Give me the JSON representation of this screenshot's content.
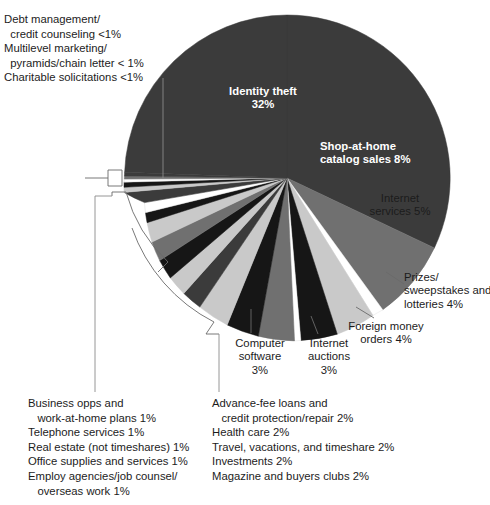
{
  "chart_data": {
    "type": "pie",
    "title": "",
    "legend_position": "callouts",
    "grid": false,
    "unit": "percent",
    "categories": [
      "Identity theft",
      "Shop-at-home catalog sales",
      "Internet services",
      "Prizes/sweepstakes and lotteries",
      "Foreign money orders",
      "Internet auctions",
      "Computer software",
      "Advance-fee loans and credit protection/repair",
      "Health care",
      "Travel, vacations, and timeshare",
      "Investments",
      "Magazine and buyers clubs",
      "Business opps and work-at-home plans",
      "Telephone services",
      "Real estate (not timeshares)",
      "Office supplies and services",
      "Employ agencies/job counsel/overseas work",
      "Debt management/credit counseling",
      "Multilevel marketing/pyramids/chain letter",
      "Charitable solicitations"
    ],
    "values": [
      32,
      8,
      5,
      4,
      4,
      3,
      3,
      2,
      2,
      2,
      2,
      2,
      1,
      1,
      1,
      1,
      1,
      0.6,
      0.6,
      0.6
    ],
    "value_labels": [
      "32%",
      "8%",
      "5%",
      "4%",
      "4%",
      "3%",
      "3%",
      "2%",
      "2%",
      "2%",
      "2%",
      "2%",
      "1%",
      "1%",
      "1%",
      "1%",
      "1%",
      "<1%",
      "< 1%",
      "<1%"
    ]
  },
  "pie_labels": {
    "identity_theft": "Identity theft\n32%",
    "shop_at_home": "Shop-at-home\ncatalog sales 8%",
    "internet_services": "Internet\nservices 5%",
    "prizes": "Prizes/\nsweepstakes and\nlotteries 4%",
    "foreign_money": "Foreign money\norders 4%",
    "computer_software": "Computer\nsoftware\n3%",
    "internet_auctions": "Internet\nauctions\n3%"
  },
  "callout_blocks": {
    "top_left": [
      "Debt management/",
      "  credit counseling <1%",
      "Multilevel marketing/",
      "  pyramids/chain letter < 1%",
      "Charitable solicitations <1%"
    ],
    "bottom_left": [
      "Business opps and",
      "   work-at-home plans 1%",
      "Telephone services 1%",
      "Real estate (not timeshares) 1%",
      "Office supplies and services 1%",
      "Employ agencies/job counsel/",
      "   overseas work 1%"
    ],
    "bottom_right": [
      "Advance-fee loans and",
      "   credit protection/repair 2%",
      "Health care 2%",
      "Travel, vacations, and timeshare 2%",
      "Investments 2%",
      "Magazine and buyers clubs 2%"
    ]
  },
  "colors": {
    "dark": "#3b3b3b",
    "mid": "#707070",
    "light": "#c9c9c9",
    "white": "#ffffff",
    "black": "#161616",
    "outline": "#4a4a4a",
    "leader": "#6a6a6a",
    "text": "#1c1c1c",
    "on_pie_text": "#ffffff",
    "background": "#ffffff"
  }
}
